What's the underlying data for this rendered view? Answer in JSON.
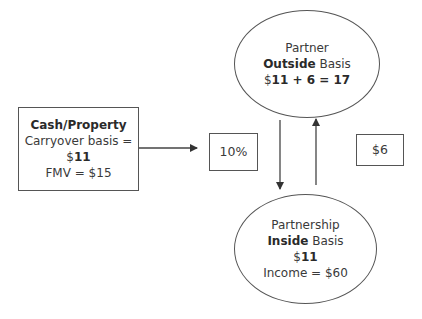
{
  "diagram": {
    "source_box": {
      "title": "Cash/Property",
      "line2": "Carryover basis =",
      "line3_prefix": "$",
      "line3_value": "11",
      "line4": "FMV = $15"
    },
    "partner_node": {
      "line1": "Partner",
      "line2_bold": "Outside",
      "line2_rest": " Basis",
      "line3_prefix": "$",
      "line3_value": "11 + 6 = 17"
    },
    "partnership_node": {
      "line1": "Partnership",
      "line2_bold": "Inside",
      "line2_rest": " Basis",
      "line3_prefix": "$",
      "line3_value": "11",
      "line4": "Income = $60"
    },
    "interest_label": {
      "text": "10%"
    },
    "share_label": {
      "text": "$6"
    },
    "edges": [
      {
        "from": "source_box",
        "to": "interest_label",
        "direction": "right"
      },
      {
        "from": "partner_node",
        "to": "partnership_node",
        "direction": "down"
      },
      {
        "from": "partnership_node",
        "to": "partner_node",
        "direction": "up"
      }
    ],
    "colors": {
      "stroke": "#555555",
      "text": "#3a3a3a",
      "background": "#ffffff"
    }
  }
}
